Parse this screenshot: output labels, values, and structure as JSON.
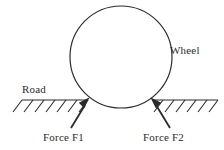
{
  "diagram": {
    "type": "physics-free-body-diagram",
    "background_color": "#ffffff",
    "stroke_color": "#2b2b2b",
    "labels": {
      "wheel": "Wheel",
      "road": "Road",
      "force_f1": "Force F1",
      "force_f2": "Force F2"
    },
    "wheel": {
      "name": "wheel-circle",
      "center_x": 121,
      "center_y": 57,
      "radius": 51,
      "fill": "none",
      "stroke_width": 1.2
    },
    "road": {
      "name": "road-surface-line",
      "y": 100,
      "left_x": 22,
      "right_x": 218,
      "gap_left_x": 86,
      "gap_right_x": 156,
      "hatch_count_left": 6,
      "hatch_count_right": 6,
      "hatch_length": 13,
      "hatch_angle_deg": 50,
      "stroke_width": 1.2
    },
    "forces": [
      {
        "name": "force-f1-arrow",
        "label": "Force F1",
        "tail_x": 71,
        "tail_y": 128,
        "head_x": 88,
        "head_y": 100,
        "direction": "up-right",
        "stroke_width": 1.8
      },
      {
        "name": "force-f2-arrow",
        "label": "Force F2",
        "tail_x": 170,
        "tail_y": 128,
        "head_x": 152,
        "head_y": 100,
        "direction": "up-left",
        "stroke_width": 1.8
      }
    ]
  }
}
